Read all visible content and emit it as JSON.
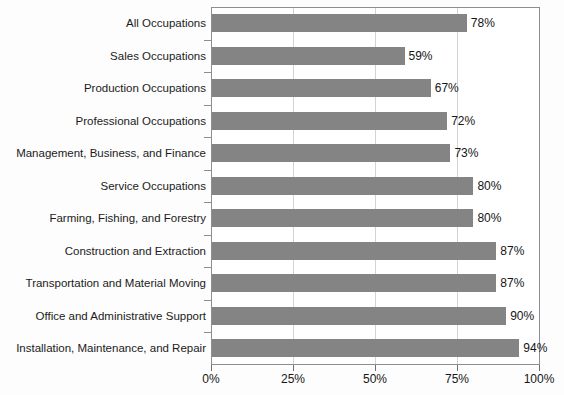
{
  "chart_data": {
    "type": "bar",
    "orientation": "horizontal",
    "title": "",
    "xlabel": "",
    "ylabel": "",
    "xlim": [
      0,
      100
    ],
    "xticks": [
      "0%",
      "25%",
      "50%",
      "75%",
      "100%"
    ],
    "xtick_values": [
      0,
      25,
      50,
      75,
      100
    ],
    "grid": "vertical",
    "legend": "none",
    "bar_color": "#848484",
    "value_suffix": "%",
    "categories": [
      "All Occupations",
      "Sales Occupations",
      "Production Occupations",
      "Professional Occupations",
      "Management, Business, and Finance",
      "Service Occupations",
      "Farming, Fishing, and Forestry",
      "Construction and Extraction",
      "Transportation and Material Moving",
      "Office and Administrative Support",
      "Installation, Maintenance, and Repair"
    ],
    "values": [
      78,
      59,
      67,
      72,
      73,
      80,
      80,
      87,
      87,
      90,
      94
    ],
    "value_labels": [
      "78%",
      "59%",
      "67%",
      "72%",
      "73%",
      "80%",
      "80%",
      "87%",
      "87%",
      "90%",
      "94%"
    ]
  },
  "title_remnant": ""
}
